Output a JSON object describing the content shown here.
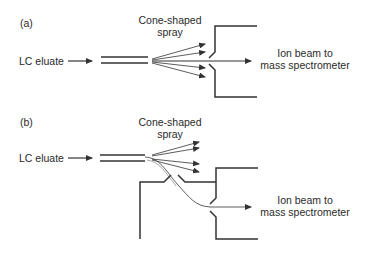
{
  "panels": [
    {
      "id": "a",
      "label": "(a)",
      "input_label": "LC eluate",
      "spray_label_line1": "Cone-shaped",
      "spray_label_line2": "spray",
      "output_label_line1": "Ion beam to",
      "output_label_line2": "mass spectrometer",
      "configuration": "on-axis"
    },
    {
      "id": "b",
      "label": "(b)",
      "input_label": "LC eluate",
      "spray_label_line1": "Cone-shaped",
      "spray_label_line2": "spray",
      "output_label_line1": "Ion beam to",
      "output_label_line2": "mass spectrometer",
      "configuration": "orthogonal / off-axis"
    }
  ],
  "colors": {
    "line": "#333333",
    "text": "#2a2a2a"
  }
}
